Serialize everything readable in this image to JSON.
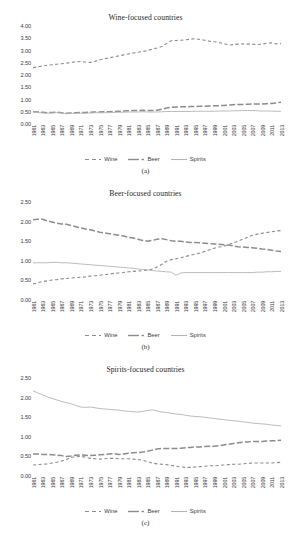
{
  "figure": {
    "panels": [
      {
        "title": "Wine-focused countries",
        "caption": "(a)"
      },
      {
        "title": "Beer-focused countries",
        "caption": "(b)"
      },
      {
        "title": "Spirits-focused countries",
        "caption": "(c)"
      }
    ],
    "legend": {
      "wine": "Wine",
      "beer": "Beer",
      "spirits": "Spirits"
    }
  },
  "chart_data": [
    {
      "type": "line",
      "title": "Wine-focused countries",
      "caption": "(a)",
      "xlabel": "",
      "ylabel": "",
      "ylim": [
        0.0,
        4.0
      ],
      "yticks": [
        "0.00",
        "0.50",
        "1.00",
        "1.50",
        "2.00",
        "2.50",
        "3.00",
        "3.50",
        "4.00"
      ],
      "grid": false,
      "legend_position": "bottom",
      "x": [
        1961,
        1962,
        1963,
        1964,
        1965,
        1966,
        1967,
        1968,
        1969,
        1970,
        1971,
        1972,
        1973,
        1974,
        1975,
        1976,
        1977,
        1978,
        1979,
        1980,
        1981,
        1982,
        1983,
        1984,
        1985,
        1986,
        1987,
        1988,
        1989,
        1990,
        1991,
        1992,
        1993,
        1994,
        1995,
        1996,
        1997,
        1998,
        1999,
        2000,
        2001,
        2002,
        2003,
        2004,
        2005,
        2006,
        2007,
        2008,
        2009,
        2010,
        2011,
        2012,
        2013
      ],
      "xtick_labels": [
        "1961",
        "1963",
        "1965",
        "1967",
        "1969",
        "1971",
        "1973",
        "1975",
        "1977",
        "1979",
        "1981",
        "1983",
        "1985",
        "1987",
        "1989",
        "1991",
        "1993",
        "1995",
        "1997",
        "1999",
        "2001",
        "2003",
        "2005",
        "2007",
        "2009",
        "2011",
        "2013"
      ],
      "series": [
        {
          "name": "Wine",
          "style": "dashed",
          "color": "#8c8c8c",
          "values": [
            2.3,
            2.33,
            2.37,
            2.4,
            2.42,
            2.44,
            2.46,
            2.48,
            2.52,
            2.54,
            2.55,
            2.53,
            2.51,
            2.56,
            2.62,
            2.66,
            2.7,
            2.74,
            2.78,
            2.82,
            2.86,
            2.9,
            2.93,
            2.96,
            3.0,
            3.06,
            3.1,
            3.16,
            3.28,
            3.4,
            3.41,
            3.42,
            3.44,
            3.46,
            3.48,
            3.45,
            3.42,
            3.38,
            3.36,
            3.33,
            3.28,
            3.22,
            3.24,
            3.26,
            3.27,
            3.26,
            3.26,
            3.24,
            3.26,
            3.3,
            3.31,
            3.27,
            3.28
          ]
        },
        {
          "name": "Beer",
          "style": "dashdot",
          "color": "#8c8c8c",
          "values": [
            0.5,
            0.49,
            0.48,
            0.46,
            0.47,
            0.48,
            0.46,
            0.44,
            0.45,
            0.46,
            0.47,
            0.47,
            0.48,
            0.49,
            0.49,
            0.5,
            0.5,
            0.51,
            0.52,
            0.53,
            0.54,
            0.55,
            0.55,
            0.56,
            0.55,
            0.55,
            0.56,
            0.6,
            0.65,
            0.68,
            0.69,
            0.7,
            0.7,
            0.71,
            0.71,
            0.72,
            0.72,
            0.73,
            0.74,
            0.75,
            0.76,
            0.77,
            0.79,
            0.8,
            0.8,
            0.81,
            0.82,
            0.82,
            0.82,
            0.83,
            0.84,
            0.86,
            0.89
          ]
        },
        {
          "name": "Spirits",
          "style": "solid",
          "color": "#b3b3b3",
          "values": [
            0.49,
            0.47,
            0.45,
            0.44,
            0.45,
            0.46,
            0.45,
            0.42,
            0.43,
            0.44,
            0.44,
            0.44,
            0.45,
            0.46,
            0.46,
            0.46,
            0.47,
            0.47,
            0.48,
            0.48,
            0.49,
            0.49,
            0.49,
            0.5,
            0.49,
            0.49,
            0.49,
            0.5,
            0.51,
            0.51,
            0.51,
            0.51,
            0.51,
            0.51,
            0.52,
            0.52,
            0.52,
            0.52,
            0.52,
            0.53,
            0.53,
            0.53,
            0.54,
            0.54,
            0.55,
            0.55,
            0.55,
            0.54,
            0.53,
            0.53,
            0.53,
            0.52,
            0.52
          ]
        }
      ]
    },
    {
      "type": "line",
      "title": "Beer-focused countries",
      "caption": "(b)",
      "xlabel": "",
      "ylabel": "",
      "ylim": [
        0.0,
        2.5
      ],
      "yticks": [
        "0.00",
        "0.50",
        "1.00",
        "1.50",
        "2.00",
        "2.50"
      ],
      "grid": false,
      "legend_position": "bottom",
      "x": [
        1961,
        1962,
        1963,
        1964,
        1965,
        1966,
        1967,
        1968,
        1969,
        1970,
        1971,
        1972,
        1973,
        1974,
        1975,
        1976,
        1977,
        1978,
        1979,
        1980,
        1981,
        1982,
        1983,
        1984,
        1985,
        1986,
        1987,
        1988,
        1989,
        1990,
        1991,
        1992,
        1993,
        1994,
        1995,
        1996,
        1997,
        1998,
        1999,
        2000,
        2001,
        2002,
        2003,
        2004,
        2005,
        2006,
        2007,
        2008,
        2009,
        2010,
        2011,
        2012,
        2013
      ],
      "xtick_labels": [
        "1961",
        "1963",
        "1965",
        "1967",
        "1969",
        "1971",
        "1973",
        "1975",
        "1977",
        "1979",
        "1981",
        "1983",
        "1985",
        "1987",
        "1989",
        "1991",
        "1993",
        "1995",
        "1997",
        "1999",
        "2001",
        "2003",
        "2005",
        "2007",
        "2009",
        "2011",
        "2013"
      ],
      "series": [
        {
          "name": "Wine",
          "style": "dashed",
          "color": "#8c8c8c",
          "values": [
            0.41,
            0.44,
            0.47,
            0.49,
            0.51,
            0.52,
            0.54,
            0.55,
            0.56,
            0.57,
            0.58,
            0.59,
            0.61,
            0.62,
            0.63,
            0.65,
            0.66,
            0.68,
            0.69,
            0.7,
            0.72,
            0.73,
            0.74,
            0.75,
            0.76,
            0.79,
            0.84,
            0.91,
            0.99,
            1.03,
            1.05,
            1.08,
            1.11,
            1.14,
            1.17,
            1.2,
            1.24,
            1.28,
            1.32,
            1.35,
            1.37,
            1.41,
            1.46,
            1.5,
            1.55,
            1.6,
            1.65,
            1.68,
            1.7,
            1.72,
            1.74,
            1.76,
            1.77
          ]
        },
        {
          "name": "Beer",
          "style": "dashdot",
          "color": "#8c8c8c",
          "values": [
            2.05,
            2.06,
            2.06,
            2.02,
            1.99,
            1.96,
            1.94,
            1.93,
            1.9,
            1.87,
            1.84,
            1.81,
            1.79,
            1.76,
            1.73,
            1.71,
            1.69,
            1.67,
            1.65,
            1.63,
            1.6,
            1.58,
            1.55,
            1.52,
            1.5,
            1.52,
            1.55,
            1.56,
            1.54,
            1.51,
            1.5,
            1.5,
            1.48,
            1.47,
            1.47,
            1.46,
            1.45,
            1.44,
            1.43,
            1.42,
            1.41,
            1.4,
            1.38,
            1.36,
            1.35,
            1.34,
            1.33,
            1.32,
            1.3,
            1.29,
            1.27,
            1.25,
            1.24
          ]
        },
        {
          "name": "Spirits",
          "style": "solid",
          "color": "#b3b3b3",
          "values": [
            0.95,
            0.95,
            0.95,
            0.95,
            0.96,
            0.96,
            0.95,
            0.95,
            0.94,
            0.93,
            0.92,
            0.91,
            0.9,
            0.89,
            0.88,
            0.87,
            0.86,
            0.85,
            0.84,
            0.83,
            0.82,
            0.81,
            0.79,
            0.78,
            0.77,
            0.75,
            0.74,
            0.73,
            0.72,
            0.71,
            0.63,
            0.69,
            0.7,
            0.7,
            0.7,
            0.7,
            0.7,
            0.7,
            0.7,
            0.7,
            0.7,
            0.7,
            0.7,
            0.7,
            0.7,
            0.7,
            0.7,
            0.71,
            0.71,
            0.72,
            0.72,
            0.73,
            0.73
          ]
        }
      ]
    },
    {
      "type": "line",
      "title": "Spirits-focused countries",
      "caption": "(c)",
      "xlabel": "",
      "ylabel": "",
      "ylim": [
        0.0,
        2.5
      ],
      "yticks": [
        "0.00",
        "0.50",
        "1.00",
        "1.50",
        "2.00",
        "2.50"
      ],
      "grid": false,
      "legend_position": "bottom",
      "x": [
        1961,
        1962,
        1963,
        1964,
        1965,
        1966,
        1967,
        1968,
        1969,
        1970,
        1971,
        1972,
        1973,
        1974,
        1975,
        1976,
        1977,
        1978,
        1979,
        1980,
        1981,
        1982,
        1983,
        1984,
        1985,
        1986,
        1987,
        1988,
        1989,
        1990,
        1991,
        1992,
        1993,
        1994,
        1995,
        1996,
        1997,
        1998,
        1999,
        2000,
        2001,
        2002,
        2003,
        2004,
        2005,
        2006,
        2007,
        2008,
        2009,
        2010,
        2011,
        2012,
        2013
      ],
      "xtick_labels": [
        "1961",
        "1963",
        "1965",
        "1967",
        "1969",
        "1971",
        "1973",
        "1975",
        "1977",
        "1979",
        "1981",
        "1983",
        "1985",
        "1987",
        "1989",
        "1991",
        "1993",
        "1995",
        "1997",
        "1999",
        "2001",
        "2003",
        "2005",
        "2007",
        "2009",
        "2011",
        "2013"
      ],
      "series": [
        {
          "name": "Wine",
          "style": "dashed",
          "color": "#8c8c8c",
          "values": [
            0.28,
            0.29,
            0.3,
            0.31,
            0.33,
            0.35,
            0.38,
            0.42,
            0.48,
            0.49,
            0.5,
            0.48,
            0.45,
            0.44,
            0.43,
            0.44,
            0.45,
            0.45,
            0.44,
            0.44,
            0.44,
            0.43,
            0.42,
            0.4,
            0.37,
            0.33,
            0.31,
            0.3,
            0.29,
            0.27,
            0.25,
            0.23,
            0.22,
            0.22,
            0.23,
            0.24,
            0.25,
            0.26,
            0.26,
            0.27,
            0.28,
            0.29,
            0.3,
            0.3,
            0.31,
            0.32,
            0.33,
            0.33,
            0.33,
            0.33,
            0.33,
            0.34,
            0.35
          ]
        },
        {
          "name": "Beer",
          "style": "dashdot",
          "color": "#8c8c8c",
          "values": [
            0.56,
            0.56,
            0.55,
            0.55,
            0.54,
            0.53,
            0.52,
            0.5,
            0.51,
            0.53,
            0.54,
            0.53,
            0.52,
            0.53,
            0.54,
            0.55,
            0.56,
            0.57,
            0.55,
            0.56,
            0.58,
            0.59,
            0.6,
            0.61,
            0.63,
            0.66,
            0.69,
            0.7,
            0.7,
            0.7,
            0.7,
            0.71,
            0.72,
            0.73,
            0.74,
            0.74,
            0.75,
            0.76,
            0.76,
            0.77,
            0.79,
            0.81,
            0.83,
            0.85,
            0.86,
            0.87,
            0.88,
            0.88,
            0.88,
            0.89,
            0.9,
            0.9,
            0.91
          ]
        },
        {
          "name": "Spirits",
          "style": "solid",
          "color": "#b3b3b3",
          "values": [
            2.17,
            2.12,
            2.07,
            2.02,
            1.98,
            1.94,
            1.9,
            1.87,
            1.84,
            1.8,
            1.76,
            1.75,
            1.76,
            1.74,
            1.72,
            1.71,
            1.7,
            1.69,
            1.68,
            1.66,
            1.65,
            1.64,
            1.63,
            1.65,
            1.67,
            1.69,
            1.66,
            1.63,
            1.62,
            1.6,
            1.58,
            1.57,
            1.55,
            1.53,
            1.52,
            1.51,
            1.5,
            1.48,
            1.47,
            1.45,
            1.44,
            1.42,
            1.41,
            1.4,
            1.38,
            1.37,
            1.35,
            1.34,
            1.33,
            1.32,
            1.3,
            1.29,
            1.28
          ]
        }
      ]
    }
  ]
}
